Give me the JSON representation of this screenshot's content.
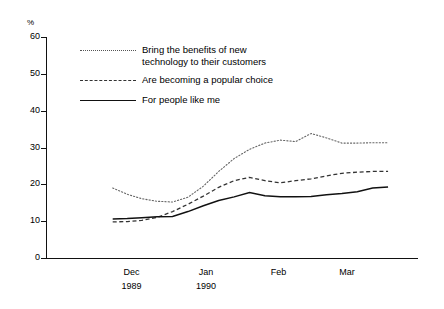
{
  "chart_data": {
    "type": "line",
    "title": "",
    "xlabel": "",
    "ylabel": "%",
    "ylim": [
      0,
      60
    ],
    "yticks": [
      0,
      10,
      20,
      30,
      40,
      50,
      60
    ],
    "xticklabels": [
      {
        "month": "Dec",
        "year": "1989"
      },
      {
        "month": "Jan",
        "year": "1990"
      },
      {
        "month": "Feb",
        "year": ""
      },
      {
        "month": "Mar",
        "year": ""
      }
    ],
    "grid": false,
    "legend_position": "upper-left-inside",
    "series": [
      {
        "name": "Bring the benefits of new technology to their customers",
        "style": "dotted",
        "color": "#666666",
        "x": [
          0.78,
          0.95,
          1.12,
          1.3,
          1.48,
          1.66,
          1.84,
          2.02,
          2.2,
          2.38,
          2.56,
          2.74,
          2.92,
          3.1,
          3.28,
          3.46,
          3.64,
          3.82,
          4.0
        ],
        "values": [
          19.0,
          17.3,
          16.1,
          15.4,
          15.2,
          16.5,
          19.5,
          23.5,
          27.0,
          29.5,
          31.2,
          32.0,
          31.6,
          33.8,
          32.6,
          31.2,
          31.2,
          31.3,
          31.3
        ]
      },
      {
        "name": "Are becoming a popular choice",
        "style": "dashed",
        "color": "#333333",
        "x": [
          0.78,
          0.95,
          1.12,
          1.3,
          1.48,
          1.66,
          1.84,
          2.02,
          2.2,
          2.38,
          2.56,
          2.74,
          2.92,
          3.1,
          3.28,
          3.46,
          3.64,
          3.82,
          4.0
        ],
        "values": [
          9.8,
          9.9,
          10.2,
          11.0,
          12.6,
          14.6,
          16.8,
          19.2,
          21.0,
          21.9,
          21.0,
          20.4,
          21.0,
          21.5,
          22.3,
          23.0,
          23.3,
          23.5,
          23.5
        ]
      },
      {
        "name": "For people like me",
        "style": "solid",
        "color": "#111111",
        "x": [
          0.78,
          0.95,
          1.12,
          1.3,
          1.48,
          1.66,
          1.84,
          2.02,
          2.2,
          2.38,
          2.56,
          2.74,
          2.92,
          3.1,
          3.28,
          3.46,
          3.64,
          3.82,
          4.0
        ],
        "values": [
          10.6,
          10.7,
          10.9,
          11.2,
          11.3,
          12.6,
          14.2,
          15.6,
          16.6,
          17.8,
          16.9,
          16.6,
          16.6,
          16.7,
          17.2,
          17.5,
          18.0,
          19.0,
          19.3
        ]
      }
    ]
  },
  "legend": {
    "items": [
      {
        "label_line1": "Bring the benefits of new",
        "label_line2": "technology to their customers",
        "style": "dotted"
      },
      {
        "label_line1": "Are becoming a popular choice",
        "label_line2": "",
        "style": "dashed"
      },
      {
        "label_line1": "For people like me",
        "label_line2": "",
        "style": "solid"
      }
    ]
  }
}
